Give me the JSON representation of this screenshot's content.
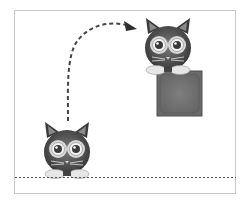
{
  "diagram": {
    "elements": {
      "cat_start": {
        "label": "cat",
        "position": "floor"
      },
      "cat_end": {
        "label": "cat",
        "position": "on-box"
      },
      "box": {
        "label": "box",
        "fill": "#6e6e6e",
        "inner": "#7a7a7a",
        "border": "#555555"
      },
      "jump_path": {
        "style": "dashed",
        "direction": "up-and-right",
        "color": "#444444"
      },
      "floor_line": {
        "style": "dotted",
        "color": "#555555"
      }
    },
    "colors": {
      "cat_body": "#3c3c3c",
      "cat_face": "#5a5a5a",
      "eye_ring": "#d8d8d8",
      "paws": "#e6e6e6",
      "frame_border": "#c8c8c8"
    }
  }
}
